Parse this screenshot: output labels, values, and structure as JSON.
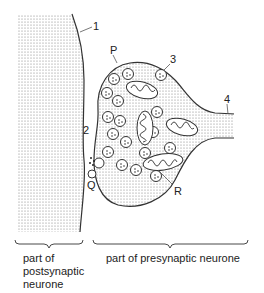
{
  "diagram": {
    "type": "synapse",
    "labels": {
      "n1": "1",
      "n2": "2",
      "n3": "3",
      "n4": "4",
      "P": "P",
      "Q": "Q",
      "R": "R"
    },
    "captions": {
      "post_line1": "part of",
      "post_line2": "postsynaptic",
      "post_line3": "neurone",
      "pre": "part of presynaptic neurone"
    },
    "colors": {
      "line": "#333333",
      "stipple": "#888888",
      "background": "#ffffff"
    },
    "vesicles": [
      [
        114,
        79
      ],
      [
        128,
        74
      ],
      [
        107,
        93
      ],
      [
        118,
        101
      ],
      [
        108,
        117
      ],
      [
        120,
        121
      ],
      [
        113,
        134
      ],
      [
        126,
        142
      ],
      [
        108,
        152
      ],
      [
        122,
        165
      ],
      [
        136,
        170
      ],
      [
        161,
        75
      ],
      [
        157,
        112
      ],
      [
        153,
        132
      ],
      [
        145,
        153
      ],
      [
        156,
        176
      ],
      [
        170,
        148
      ]
    ]
  }
}
